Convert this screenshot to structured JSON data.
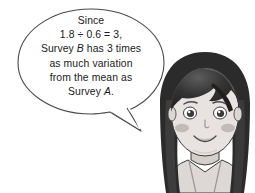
{
  "scene": {
    "title": "cartoon-girl-with-speech-bubble",
    "background_color": "#ffffff"
  },
  "speech_bubble": {
    "outline_color": "#4a4a4a",
    "fill_color": "#ffffff",
    "text_color": "#1a1a1a",
    "lines": [
      {
        "id": "line1",
        "text": "Since"
      },
      {
        "id": "line2",
        "text": "1.8 ÷ 0.6 = 3,"
      },
      {
        "id": "line3",
        "prefix": "Survey ",
        "emphasis": "B",
        "suffix": " has 3 times"
      },
      {
        "id": "line4",
        "text": "as much variation"
      },
      {
        "id": "line5",
        "text": "from the mean as"
      },
      {
        "id": "line6",
        "prefix": "Survey ",
        "emphasis": "A",
        "suffix": "."
      }
    ],
    "full_text": "Since 1.8 ÷ 0.6 = 3, Survey B has 3 times as much variation from the mean as Survey A."
  },
  "character": {
    "name": "girl-speaker",
    "description": "grayscale cartoon girl with long dark hair, bangs, smiling",
    "hair_color": "#2b2b2b",
    "hair_highlight_color": "#8a8a8a",
    "skin_color": "#e8e3e0",
    "skin_shadow_color": "#cfc9c6",
    "blush_color": "#bdb4b2",
    "eye_color": "#3a3a3a",
    "top_color": "#ddd8d5",
    "outline_color": "#3a3a3a"
  }
}
